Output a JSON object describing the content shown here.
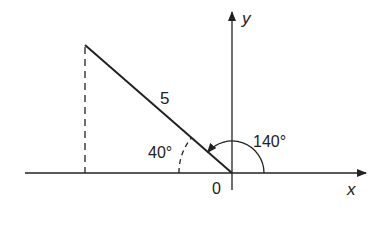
{
  "diagram": {
    "type": "polar-angle-diagram",
    "axes": {
      "x_label": "x",
      "y_label": "y",
      "origin_label": "0"
    },
    "segment": {
      "length_label": "5",
      "angle_from_positive_x_deg": 140
    },
    "angles": {
      "standard_angle_label": "140°",
      "reference_angle_label": "40°"
    },
    "colors": {
      "stroke": "#222222",
      "background": "#ffffff"
    }
  }
}
